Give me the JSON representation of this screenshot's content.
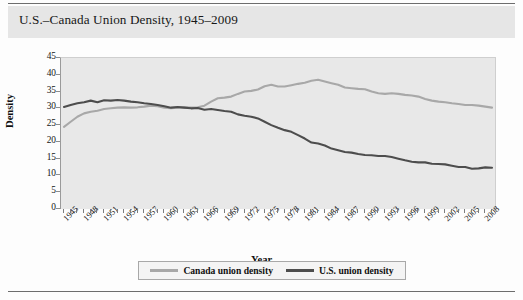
{
  "header": {
    "title": "U.S.–Canada Union Density, 1945–2009"
  },
  "axes": {
    "y_title": "Density",
    "x_title": "Year",
    "y_labels": [
      "45",
      "40",
      "35",
      "30",
      "25",
      "20",
      "15",
      "10",
      "5",
      "0"
    ]
  },
  "legend": {
    "items": [
      {
        "label": "Canada union density",
        "color": "#a8a8a8",
        "name": "legend-item-canada"
      },
      {
        "label": "U.S. union density",
        "color": "#4d4d4d",
        "name": "legend-item-us"
      }
    ]
  },
  "chart_data": {
    "type": "line",
    "title": "U.S.–Canada Union Density, 1945–2009",
    "xlabel": "Year",
    "ylabel": "Density",
    "xlim": [
      1945,
      2009
    ],
    "ylim": [
      0,
      45
    ],
    "ytick_step": 5,
    "grid": false,
    "legend_position": "bottom",
    "tick_labels_x": [
      "1945",
      "1948",
      "1951",
      "1954",
      "1957",
      "1960",
      "1963",
      "1966",
      "1969",
      "1972",
      "1975",
      "1978",
      "1981",
      "1984",
      "1987",
      "1990",
      "1993",
      "1996",
      "1999",
      "2002",
      "2005",
      "2008"
    ],
    "tick_label_interval_years": 3,
    "x": [
      1945,
      1946,
      1947,
      1948,
      1949,
      1950,
      1951,
      1952,
      1953,
      1954,
      1955,
      1956,
      1957,
      1958,
      1959,
      1960,
      1961,
      1962,
      1963,
      1964,
      1965,
      1966,
      1967,
      1968,
      1969,
      1970,
      1971,
      1972,
      1973,
      1974,
      1975,
      1976,
      1977,
      1978,
      1979,
      1980,
      1981,
      1982,
      1983,
      1984,
      1985,
      1986,
      1987,
      1988,
      1989,
      1990,
      1991,
      1992,
      1993,
      1994,
      1995,
      1996,
      1997,
      1998,
      1999,
      2000,
      2001,
      2002,
      2003,
      2004,
      2005,
      2006,
      2007,
      2008,
      2009
    ],
    "series": [
      {
        "name": "Canada union density",
        "color": "#a8a8a8",
        "values": [
          24.5,
          26.0,
          27.5,
          28.5,
          29.0,
          29.3,
          29.8,
          30.0,
          30.2,
          30.3,
          30.2,
          30.3,
          30.5,
          30.8,
          30.6,
          30.2,
          30.0,
          30.2,
          30.3,
          30.2,
          30.3,
          30.8,
          32.0,
          33.0,
          33.2,
          33.5,
          34.3,
          35.0,
          35.2,
          35.6,
          36.6,
          37.0,
          36.5,
          36.5,
          36.9,
          37.3,
          37.6,
          38.2,
          38.5,
          38.0,
          37.5,
          37.0,
          36.2,
          36.0,
          35.8,
          35.7,
          35.0,
          34.5,
          34.3,
          34.5,
          34.3,
          34.0,
          33.8,
          33.5,
          32.8,
          32.3,
          32.0,
          31.8,
          31.5,
          31.3,
          31.0,
          31.0,
          30.8,
          30.5,
          30.2
        ]
      },
      {
        "name": "U.S. union density",
        "color": "#4d4d4d",
        "values": [
          30.4,
          31.0,
          31.5,
          31.8,
          32.3,
          31.8,
          32.4,
          32.3,
          32.5,
          32.3,
          32.0,
          31.8,
          31.5,
          31.3,
          31.0,
          30.6,
          30.2,
          30.4,
          30.2,
          30.0,
          30.1,
          29.6,
          29.8,
          29.5,
          29.2,
          29.0,
          28.2,
          27.8,
          27.5,
          27.0,
          26.0,
          25.0,
          24.2,
          23.5,
          23.0,
          22.0,
          21.0,
          19.8,
          19.5,
          18.9,
          18.0,
          17.5,
          17.0,
          16.8,
          16.4,
          16.1,
          16.0,
          15.8,
          15.8,
          15.5,
          15.0,
          14.5,
          14.1,
          13.9,
          13.9,
          13.5,
          13.4,
          13.3,
          12.9,
          12.5,
          12.5,
          12.0,
          12.1,
          12.4,
          12.3
        ]
      }
    ]
  }
}
